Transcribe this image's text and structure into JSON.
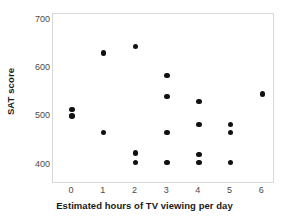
{
  "chart_data": {
    "type": "scatter",
    "title": "",
    "xlabel": "Estimated hours of TV viewing per day",
    "ylabel": "SAT score",
    "xlim": [
      -0.6,
      6.4
    ],
    "ylim": [
      360,
      712
    ],
    "xticks": [
      0,
      1,
      2,
      3,
      4,
      5,
      6
    ],
    "xtick_labels": [
      "0",
      "1",
      "2",
      "3",
      "4",
      "5",
      "6"
    ],
    "yticks": [
      400,
      500,
      600,
      700
    ],
    "ytick_labels": [
      "400",
      "500",
      "600",
      "700"
    ],
    "grid": false,
    "legend": null,
    "marker": {
      "shape": "circle",
      "color": "#111111",
      "size_px": 5.4
    },
    "frame_color": "#d8d8d8",
    "background": "#ffffff",
    "points": [
      {
        "x": 0,
        "y": 514
      },
      {
        "x": 0,
        "y": 501
      },
      {
        "x": 1,
        "y": 631
      },
      {
        "x": 1,
        "y": 467
      },
      {
        "x": 2,
        "y": 645
      },
      {
        "x": 2,
        "y": 424
      },
      {
        "x": 2,
        "y": 404
      },
      {
        "x": 3,
        "y": 585
      },
      {
        "x": 3,
        "y": 541
      },
      {
        "x": 3,
        "y": 467
      },
      {
        "x": 3,
        "y": 404
      },
      {
        "x": 4,
        "y": 531
      },
      {
        "x": 4,
        "y": 483
      },
      {
        "x": 4,
        "y": 421
      },
      {
        "x": 4,
        "y": 404
      },
      {
        "x": 5,
        "y": 483
      },
      {
        "x": 5,
        "y": 467
      },
      {
        "x": 5,
        "y": 404
      },
      {
        "x": 6,
        "y": 546
      }
    ]
  }
}
